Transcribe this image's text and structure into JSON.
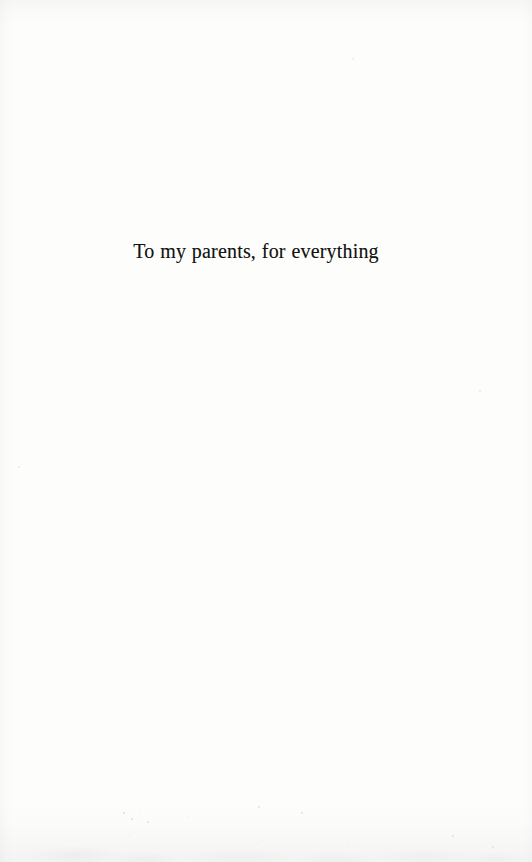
{
  "page": {
    "kind": "book-dedication-page",
    "width": 532,
    "height": 862,
    "background_color": "#fdfdfd",
    "ink_color": "#141414"
  },
  "dedication": {
    "text": "To my parents, for everything"
  },
  "artifacts": {
    "specks": [
      {
        "x": 123,
        "y": 812,
        "size": 2.0,
        "opacity": 0.3
      },
      {
        "x": 131,
        "y": 818,
        "size": 1.5,
        "opacity": 0.24
      },
      {
        "x": 139,
        "y": 810,
        "size": 1.2,
        "opacity": 0.2
      },
      {
        "x": 147,
        "y": 821,
        "size": 1.7,
        "opacity": 0.26
      },
      {
        "x": 188,
        "y": 816,
        "size": 1.3,
        "opacity": 0.2
      },
      {
        "x": 129,
        "y": 835,
        "size": 1.4,
        "opacity": 0.22
      },
      {
        "x": 201,
        "y": 838,
        "size": 1.2,
        "opacity": 0.18
      },
      {
        "x": 258,
        "y": 806,
        "size": 1.6,
        "opacity": 0.24
      },
      {
        "x": 262,
        "y": 840,
        "size": 1.3,
        "opacity": 0.2
      },
      {
        "x": 301,
        "y": 812,
        "size": 1.5,
        "opacity": 0.22
      },
      {
        "x": 348,
        "y": 843,
        "size": 1.4,
        "opacity": 0.2
      },
      {
        "x": 434,
        "y": 828,
        "size": 1.3,
        "opacity": 0.19
      },
      {
        "x": 452,
        "y": 835,
        "size": 1.5,
        "opacity": 0.22
      },
      {
        "x": 489,
        "y": 818,
        "size": 1.2,
        "opacity": 0.18
      },
      {
        "x": 492,
        "y": 846,
        "size": 1.6,
        "opacity": 0.21
      },
      {
        "x": 443,
        "y": 372,
        "size": 1.4,
        "opacity": 0.17
      },
      {
        "x": 479,
        "y": 390,
        "size": 1.8,
        "opacity": 0.16
      },
      {
        "x": 489,
        "y": 510,
        "size": 1.3,
        "opacity": 0.15
      },
      {
        "x": 30,
        "y": 288,
        "size": 1.4,
        "opacity": 0.15
      },
      {
        "x": 18,
        "y": 466,
        "size": 1.6,
        "opacity": 0.16
      },
      {
        "x": 24,
        "y": 614,
        "size": 1.2,
        "opacity": 0.14
      },
      {
        "x": 96,
        "y": 90,
        "size": 1.3,
        "opacity": 0.14
      },
      {
        "x": 352,
        "y": 58,
        "size": 1.5,
        "opacity": 0.13
      }
    ]
  }
}
